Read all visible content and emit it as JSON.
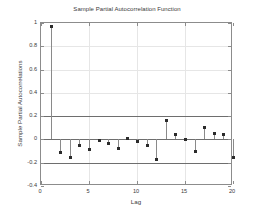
{
  "chart_data": {
    "type": "scatter",
    "title": "Sample Partial Autocorrelation Function",
    "xlabel": "Lag",
    "ylabel": "Sample Partial Autocorrelations",
    "x": [
      1,
      2,
      3,
      4,
      5,
      6,
      7,
      8,
      9,
      10,
      11,
      12,
      13,
      14,
      15,
      16,
      17,
      18,
      19,
      20
    ],
    "values": [
      0.97,
      -0.11,
      -0.155,
      -0.05,
      -0.09,
      -0.01,
      -0.035,
      -0.08,
      0.01,
      -0.015,
      -0.055,
      -0.17,
      0.16,
      0.04,
      0.0,
      -0.1,
      0.1,
      0.05,
      0.04,
      -0.155
    ],
    "xlim": [
      0,
      20
    ],
    "ylim": [
      -0.4,
      1.0
    ],
    "xticks": [
      0,
      5,
      10,
      15,
      20
    ],
    "xtick_labels": [
      "0",
      "5",
      "10",
      "15",
      "20"
    ],
    "yticks": [
      -0.4,
      -0.2,
      0,
      0.2,
      0.4,
      0.6,
      0.8,
      1.0
    ],
    "ytick_labels": [
      "-0.4",
      "-0.2",
      "0",
      "0.2",
      "0.4",
      "0.6",
      "0.8",
      "1"
    ],
    "grid": true,
    "legend": null,
    "confidence_bounds": [
      0.2,
      -0.2
    ],
    "zero_line": 0,
    "marker_color": "#2b2b2b",
    "stem_color": "#8a8a8a",
    "bound_color": "#6e6e6e",
    "grid_color": "#e6e6e6",
    "axis_color": "#8c8c8c",
    "background_color": "#ffffff"
  }
}
